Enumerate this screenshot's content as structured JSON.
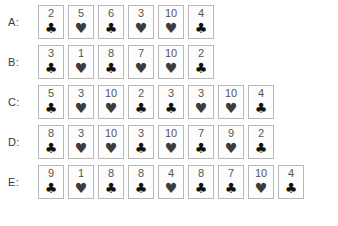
{
  "figure": {
    "title": "",
    "background_color": "#ffffff",
    "card_border_color": "#b8b8b8",
    "card_face_color": "#fdfdfd",
    "rank_text_color": "#555555",
    "club_color": "#111111",
    "heart_color": "#3c3c3c"
  },
  "suit_glyphs": {
    "club": "♣",
    "heart": "♥",
    "spade": "♠",
    "diamond": "♦"
  },
  "rows": [
    {
      "label": "A:",
      "id": "row-a",
      "cards": [
        {
          "rank": "2",
          "suit": "club"
        },
        {
          "rank": "5",
          "suit": "heart"
        },
        {
          "rank": "6",
          "suit": "club"
        },
        {
          "rank": "3",
          "suit": "heart"
        },
        {
          "rank": "10",
          "suit": "heart"
        },
        {
          "rank": "4",
          "suit": "club"
        }
      ]
    },
    {
      "label": "B:",
      "id": "row-b",
      "cards": [
        {
          "rank": "3",
          "suit": "club"
        },
        {
          "rank": "1",
          "suit": "heart"
        },
        {
          "rank": "8",
          "suit": "club"
        },
        {
          "rank": "7",
          "suit": "heart"
        },
        {
          "rank": "10",
          "suit": "heart"
        },
        {
          "rank": "2",
          "suit": "club"
        }
      ]
    },
    {
      "label": "C:",
      "id": "row-c",
      "cards": [
        {
          "rank": "5",
          "suit": "club"
        },
        {
          "rank": "3",
          "suit": "heart"
        },
        {
          "rank": "10",
          "suit": "heart"
        },
        {
          "rank": "2",
          "suit": "club"
        },
        {
          "rank": "3",
          "suit": "club"
        },
        {
          "rank": "3",
          "suit": "heart"
        },
        {
          "rank": "10",
          "suit": "heart"
        },
        {
          "rank": "4",
          "suit": "club"
        }
      ]
    },
    {
      "label": "D:",
      "id": "row-d",
      "cards": [
        {
          "rank": "8",
          "suit": "club"
        },
        {
          "rank": "3",
          "suit": "heart"
        },
        {
          "rank": "10",
          "suit": "heart"
        },
        {
          "rank": "3",
          "suit": "club"
        },
        {
          "rank": "10",
          "suit": "heart"
        },
        {
          "rank": "7",
          "suit": "club"
        },
        {
          "rank": "9",
          "suit": "heart"
        },
        {
          "rank": "2",
          "suit": "club"
        }
      ]
    },
    {
      "label": "E:",
      "id": "row-e",
      "cards": [
        {
          "rank": "9",
          "suit": "club"
        },
        {
          "rank": "1",
          "suit": "heart"
        },
        {
          "rank": "8",
          "suit": "club"
        },
        {
          "rank": "8",
          "suit": "club"
        },
        {
          "rank": "4",
          "suit": "heart"
        },
        {
          "rank": "8",
          "suit": "club"
        },
        {
          "rank": "7",
          "suit": "club"
        },
        {
          "rank": "10",
          "suit": "heart"
        },
        {
          "rank": "4",
          "suit": "club"
        }
      ]
    }
  ]
}
